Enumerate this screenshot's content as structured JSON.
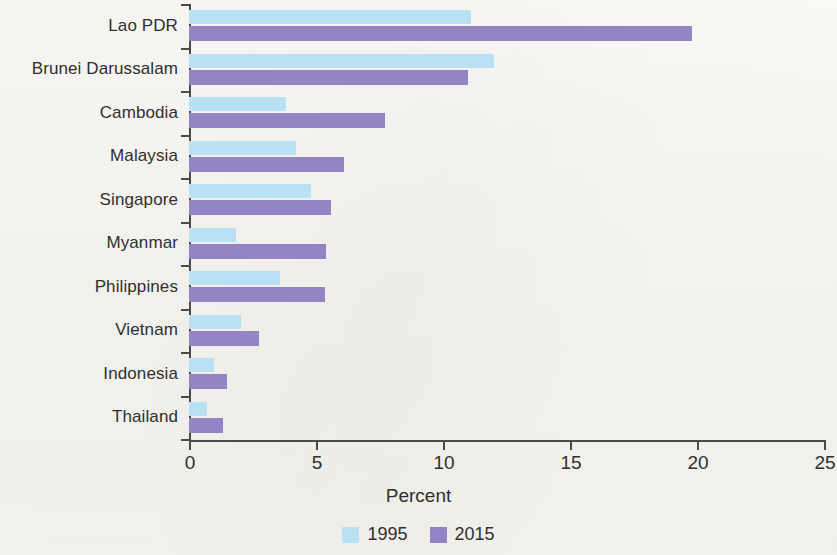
{
  "chart_data": {
    "type": "bar",
    "orientation": "horizontal",
    "title": "",
    "xlabel": "Percent",
    "ylabel": "",
    "xlim": [
      0,
      25
    ],
    "xticks": [
      0,
      5,
      10,
      15,
      20,
      25
    ],
    "xtick_labels": [
      "0",
      "5",
      "10",
      "15",
      "20",
      "25"
    ],
    "grid": false,
    "legend_position": "bottom-center",
    "categories": [
      "Lao PDR",
      "Brunei Darussalam",
      "Cambodia",
      "Malaysia",
      "Singapore",
      "Myanmar",
      "Philippines",
      "Vietnam",
      "Indonesia",
      "Thailand"
    ],
    "series": [
      {
        "name": "1995",
        "color": "#b9e0f5",
        "values": [
          11.1,
          12.0,
          3.8,
          4.2,
          4.8,
          1.85,
          3.6,
          2.05,
          1.0,
          0.7
        ]
      },
      {
        "name": "2015",
        "color": "#9384c4",
        "values": [
          19.8,
          11.0,
          7.7,
          6.1,
          5.6,
          5.4,
          5.35,
          2.75,
          1.5,
          1.35
        ]
      }
    ]
  },
  "axis": {
    "xlabel": "Percent"
  },
  "legend": {
    "entries": [
      {
        "label": "1995",
        "color": "#b9e0f5"
      },
      {
        "label": "2015",
        "color": "#9384c4"
      }
    ]
  },
  "colors": {
    "series_1995": "#b9e0f5",
    "series_2015": "#9384c4",
    "axis": "#4a4a4a",
    "background": "#f8f7f3",
    "text": "#2f2f2f"
  }
}
